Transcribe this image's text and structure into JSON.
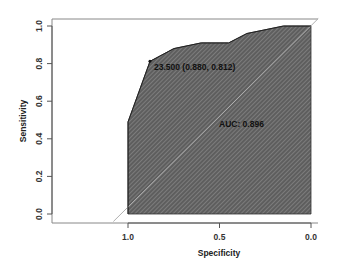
{
  "chart_data": {
    "type": "line",
    "title": "",
    "xlabel": "Specificity",
    "ylabel": "Sensitivity",
    "xlim": [
      1.4,
      -0.05
    ],
    "ylim": [
      -0.05,
      1.05
    ],
    "x_reversed": true,
    "x_ticks": [
      1.0,
      0.5,
      0.0
    ],
    "x_tick_labels": [
      "1.0",
      "0.5",
      "0.0"
    ],
    "y_ticks": [
      0.0,
      0.2,
      0.4,
      0.6,
      0.8,
      1.0
    ],
    "y_tick_labels": [
      "0.0",
      "0.2",
      "0.4",
      "0.6",
      "0.8",
      "1.0"
    ],
    "grid": false,
    "legend": null,
    "series": [
      {
        "name": "ROC curve",
        "x": [
          1.0,
          1.0,
          0.88,
          0.75,
          0.6,
          0.45,
          0.35,
          0.15,
          0.0
        ],
        "y": [
          0.0,
          0.49,
          0.812,
          0.88,
          0.91,
          0.91,
          0.96,
          1.0,
          1.0
        ],
        "fill": "hatched-auc"
      },
      {
        "name": "Reference diagonal",
        "x": [
          1.0,
          0.0
        ],
        "y": [
          0.0,
          1.0
        ]
      }
    ],
    "annotations": [
      {
        "text": "23.500 (0.880, 0.812)",
        "x": 0.88,
        "y": 0.812,
        "type": "threshold"
      },
      {
        "text": "AUC: 0.896",
        "x": 0.5,
        "y": 0.45,
        "type": "auc"
      }
    ],
    "auc": 0.896,
    "best_threshold": {
      "threshold": 23.5,
      "specificity": 0.88,
      "sensitivity": 0.812
    }
  },
  "labels": {
    "xlabel": "Specificity",
    "ylabel": "Sensitivity",
    "threshold_label": "23.500 (0.880, 0.812)",
    "auc_label": "AUC: 0.896",
    "xtick_0": "1.0",
    "xtick_1": "0.5",
    "xtick_2": "0.0",
    "ytick_0": "0.0",
    "ytick_1": "0.2",
    "ytick_2": "0.4",
    "ytick_3": "0.6",
    "ytick_4": "0.8",
    "ytick_5": "1.0"
  },
  "colors": {
    "fill": "#6b6b6b",
    "hatch": "#9a9a9a",
    "axis": "#555555",
    "text": "#222222"
  }
}
